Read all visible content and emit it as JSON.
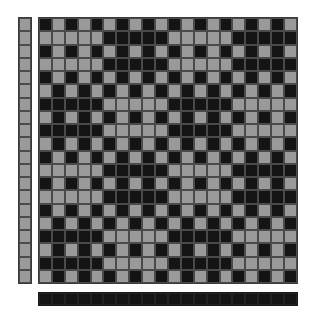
{
  "colors": {
    "gray": "#9a9a9a",
    "black": "#141414",
    "grid_line": "#4a4a4a",
    "background": "#ffffff"
  },
  "draft": {
    "columns": 20,
    "rows": 20,
    "legend": {
      "g": "gray",
      "b": "black"
    },
    "left_column": [
      "g",
      "g",
      "g",
      "g",
      "g",
      "g",
      "g",
      "g",
      "g",
      "g",
      "g",
      "g",
      "g",
      "g",
      "g",
      "g",
      "g",
      "g",
      "g",
      "g"
    ],
    "bottom_bar": [
      "b",
      "b",
      "b",
      "b",
      "b",
      "b",
      "b",
      "b",
      "b",
      "b",
      "b",
      "b",
      "b",
      "b",
      "b",
      "b",
      "b",
      "b",
      "b",
      "b"
    ],
    "grid": [
      "bgbgbgbgbgbgbgbgbgbg",
      "gggggbbbbbgggggbbbbb",
      "bgbgbgbgbgbgbgbgbgbg",
      "gggggbbbbbgggggbbbbb",
      "bgbgbgbgbgbgbgbgbgbg",
      "gbgbgbgbgbgbgbgbgbgb",
      "bbbbbgggggbbbbbggggg",
      "gbgbgbgbgbgbgbgbgbgb",
      "bbbbbgggggbbbbbggggg",
      "gbgbgbgbgbgbgbgbgbgb",
      "bgbgbgbgbgbgbgbgbgbg",
      "gggggbbbbbgggggbbbbb",
      "bgbgbgbgbgbgbgbgbgbg",
      "gggggbbbbbgggggbbbbb",
      "bgbgbgbgbgbgbgbgbgbg",
      "gbgbgbgbgbgbgbgbgbgb",
      "bbbbbgggggbbbbbggggg",
      "gbgbgbgbgbgbgbgbgbgb",
      "bbbbbgggggbbbbbggggg",
      "gbgbgbgbgbgbgbgbgbgb"
    ]
  }
}
